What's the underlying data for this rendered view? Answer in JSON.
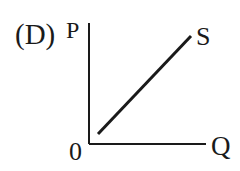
{
  "diagram": {
    "option_label": "(D)",
    "y_axis_label": "P",
    "x_axis_label": "Q",
    "origin_label": "0",
    "curve_label": "S",
    "curve_type": "upward-sloping straight line from near origin",
    "colors": {
      "ink": "#1a1a1a",
      "background": "#ffffff"
    }
  }
}
